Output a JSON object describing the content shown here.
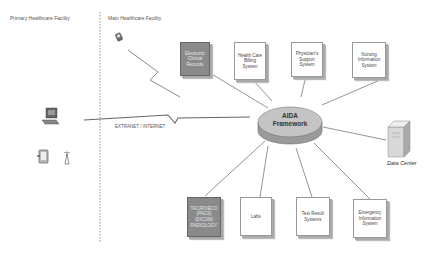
{
  "regions": {
    "primary": "Primary Healthcare Facility",
    "main": "Main Healthcare Facility"
  },
  "link_label": "EXTRANET / INTERNET",
  "hub": {
    "line1": "AIDA",
    "line2": "Framework"
  },
  "data_center": "Data Center",
  "top_boxes": [
    {
      "label": "Electronic Clinical Records",
      "dark": true
    },
    {
      "label": "Health Care Billing System",
      "dark": false
    },
    {
      "label": "Physician's Support System",
      "dark": false
    },
    {
      "label": "Nursing Information System",
      "dark": false
    }
  ],
  "bottom_boxes": [
    {
      "label": "TAC/RX/ECO (PACS) (DICOM) RADIOLOGY",
      "dark": true
    },
    {
      "label": "Labs",
      "dark": false
    },
    {
      "label": "Test Result Systems",
      "dark": false
    },
    {
      "label": "Emergency Information System",
      "dark": false
    }
  ],
  "icons": [
    "pda-icon",
    "desktop-computer-icon",
    "tablet-icon",
    "wireless-antenna-icon",
    "server-icon"
  ]
}
